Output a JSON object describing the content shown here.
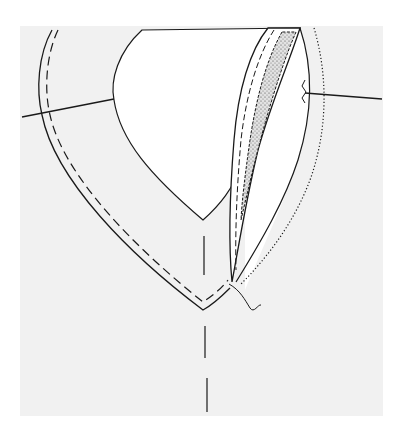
{
  "figure": {
    "colors": {
      "background": "#ffffff",
      "fabric": "#f1f1f1",
      "line": "#1a1a1a",
      "stipple": "#d8d8d8"
    }
  },
  "elements": {
    "fabric_panel": "garment-front",
    "neck_opening": "v-neckline-cutout",
    "outer_edge": "facing-outer-edge",
    "stitch_line": "staystitch-dashed",
    "center_front": "center-front-dashed-line",
    "left_shoulder": "left-shoulder-seam",
    "right_shoulder": "right-shoulder-seam",
    "facing_flap": "turned-back-facing",
    "interfacing": "stippled-interfacing",
    "dotted_line": "fold-dotted-line",
    "thread_tail": "thread-end"
  }
}
